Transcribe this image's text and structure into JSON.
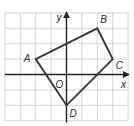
{
  "diagram": {
    "type": "coordinate-plane-quadrilateral",
    "grid": {
      "x_min": -4,
      "x_max": 4,
      "y_min": -3,
      "y_max": 4,
      "unit_px": 15.4,
      "origin_px": [
        66.5,
        74.5
      ],
      "grid_color": "#c9c9c9"
    },
    "axes": {
      "x_label": "x",
      "y_label": "y",
      "origin_label": "O",
      "axis_color": "#222222"
    },
    "polygon": {
      "stroke_color": "#3a3a3a",
      "vertices": [
        {
          "name": "A",
          "x": -2,
          "y": 1
        },
        {
          "name": "B",
          "x": 2,
          "y": 3
        },
        {
          "name": "C",
          "x": 3,
          "y": 1
        },
        {
          "name": "D",
          "x": 0,
          "y": -2
        }
      ]
    }
  },
  "chart_data": {
    "type": "scatter",
    "title": "",
    "xlabel": "x",
    "ylabel": "y",
    "xlim": [
      -4,
      4
    ],
    "ylim": [
      -3,
      4
    ],
    "grid": true,
    "series": [
      {
        "name": "Quadrilateral ABCD",
        "points": [
          {
            "label": "A",
            "x": -2,
            "y": 1
          },
          {
            "label": "B",
            "x": 2,
            "y": 3
          },
          {
            "label": "C",
            "x": 3,
            "y": 1
          },
          {
            "label": "D",
            "x": 0,
            "y": -2
          }
        ],
        "closed": true
      }
    ]
  }
}
